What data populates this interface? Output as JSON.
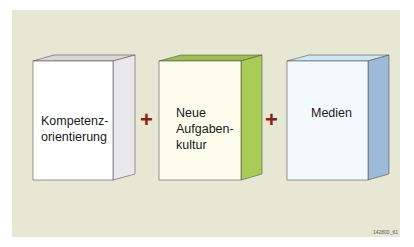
{
  "diagram": {
    "boxes": [
      {
        "label": "Kompetenz-\norientierung",
        "line1": "Kompetenz-",
        "line2": "orientierung",
        "front_color": "#ffffff",
        "side_color": "#e9e9ec",
        "top_color": "#d8d8d8"
      },
      {
        "label": "Neue Aufgaben-kultur",
        "line1": "Neue",
        "line2": "Aufgaben-",
        "line3": "kultur",
        "front_color": "#fbfcec",
        "side_color": "#a9cc57",
        "top_color": "#9cbf4a"
      },
      {
        "label": "Medien",
        "line1": "Medien",
        "front_color": "#f4f9fd",
        "side_color": "#9dbbd8",
        "top_color": "#cde6f4"
      }
    ],
    "operators": [
      "+",
      "+"
    ],
    "operator_color": "#8a1f16",
    "background_color": "#e7e8d3",
    "figure_code": "142800_61"
  }
}
